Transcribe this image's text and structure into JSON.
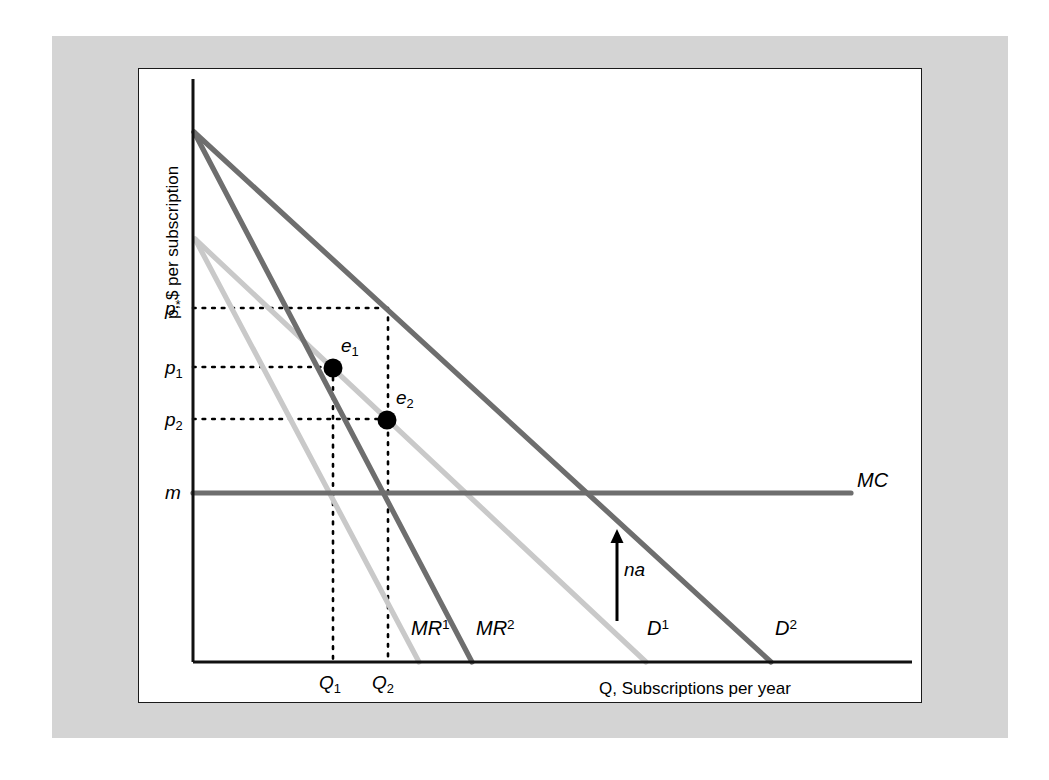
{
  "figure": {
    "background_mat_color": "#d4d4d4",
    "panel_background": "#ffffff",
    "panel_border_color": "#1a1a1a"
  },
  "chart_data": {
    "type": "line",
    "title": "",
    "xlabel": "Q, Subscriptions per year",
    "ylabel": "p, $ per subscription",
    "grid": false,
    "legend": "inline-curve-labels",
    "axis_units": "unlabeled (schematic economics diagram)",
    "colors": {
      "demand_1": "#c9c9c9",
      "marginal_revenue_1": "#c9c9c9",
      "demand_2": "#6e6e6e",
      "marginal_revenue_2": "#6e6e6e",
      "marginal_cost": "#6e6e6e",
      "axis": "#111111",
      "dotted_guides": "#000000",
      "equilibrium_dots": "#000000",
      "shift_arrow": "#000000"
    },
    "x_ticks": [
      {
        "label": "Q",
        "sub": "1",
        "x": 331
      },
      {
        "label": "Q",
        "sub": "2",
        "x": 383
      }
    ],
    "y_ticks": [
      {
        "label": "p",
        "sup": "*",
        "y": 307
      },
      {
        "label": "p",
        "sub": "1",
        "y": 366
      },
      {
        "label": "p",
        "sub": "2",
        "y": 418
      },
      {
        "label": "m",
        "y": 492
      }
    ],
    "series": [
      {
        "name": "D",
        "superscript": "1",
        "label": "D¹",
        "role": "demand curve before advertising",
        "color": "#c9c9c9",
        "points": [
          [
            194,
            238
          ],
          [
            645,
            661
          ]
        ],
        "label_pos": [
          651,
          628
        ]
      },
      {
        "name": "D",
        "superscript": "2",
        "label": "D²",
        "role": "demand curve after advertising",
        "color": "#6e6e6e",
        "points": [
          [
            193,
            131
          ],
          [
            770,
            661
          ]
        ],
        "label_pos": [
          779,
          628
        ]
      },
      {
        "name": "MR",
        "superscript": "1",
        "label": "MR¹",
        "role": "marginal revenue before advertising",
        "color": "#c9c9c9",
        "points": [
          [
            194,
            238
          ],
          [
            418,
            661
          ]
        ],
        "label_pos": [
          418,
          628
        ]
      },
      {
        "name": "MR",
        "superscript": "2",
        "label": "MR²",
        "role": "marginal revenue after advertising",
        "color": "#6e6e6e",
        "points": [
          [
            193,
            131
          ],
          [
            471,
            661
          ]
        ],
        "label_pos": [
          481,
          628
        ]
      },
      {
        "name": "MC",
        "label": "MC",
        "role": "constant marginal cost",
        "color": "#6e6e6e",
        "points": [
          [
            192,
            492
          ],
          [
            850,
            492
          ]
        ],
        "label_pos": [
          858,
          480
        ]
      }
    ],
    "annotations": [
      {
        "name": "equilibrium-point-1",
        "label": "e",
        "sub": "1",
        "x": 332,
        "y": 367,
        "label_pos": [
          340,
          344
        ],
        "description": "monopoly optimum before advertising, price p1 quantity Q1"
      },
      {
        "name": "equilibrium-point-2",
        "label": "e",
        "sub": "2",
        "x": 386,
        "y": 419,
        "label_pos": [
          395,
          396
        ],
        "description": "monopoly optimum after advertising, price p2 quantity Q2"
      },
      {
        "name": "shift-arrow-label",
        "label": "na",
        "arrow_x": 616,
        "arrow_y_start": 620,
        "arrow_y_end": 528,
        "label_pos": [
          623,
          570
        ],
        "description": "upward arrow indicating demand shift from advertising"
      }
    ],
    "guide_lines": {
      "horizontal": [
        {
          "from_y": 307,
          "x_start": 192,
          "x_end": 387,
          "for": "p*"
        },
        {
          "from_y": 366,
          "x_start": 192,
          "x_end": 332,
          "for": "p1"
        },
        {
          "from_y": 418,
          "x_start": 192,
          "x_end": 386,
          "for": "p2"
        }
      ],
      "vertical": [
        {
          "x": 332,
          "y_start": 367,
          "y_end": 661,
          "for": "Q1"
        },
        {
          "x": 387,
          "y_start": 307,
          "y_end": 661,
          "for": "Q2"
        }
      ]
    },
    "axes": {
      "origin": [
        192,
        661
      ],
      "y_axis_top": 78,
      "x_axis_right": 911
    }
  }
}
